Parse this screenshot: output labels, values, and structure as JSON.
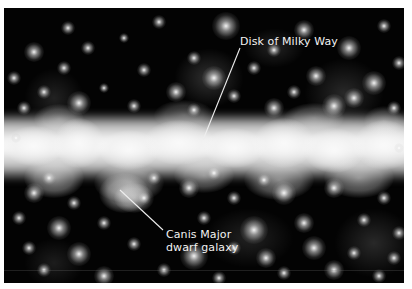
{
  "image": {
    "description": "Infrared star field showing the bright band of the Milky Way disk with the Canis Major dwarf galaxy below it",
    "background_color": "#030303",
    "frame_color": "#ffffff"
  },
  "annotations": [
    {
      "id": "disk",
      "lines": [
        "Disk of Milky Way"
      ],
      "text_pos": [
        236,
        27
      ],
      "leader": {
        "x1": 236,
        "y1": 40,
        "x2": 199,
        "y2": 132
      }
    },
    {
      "id": "canis",
      "lines": [
        "Canis Major",
        "dwarf galaxy"
      ],
      "text_pos": [
        162,
        220
      ],
      "leader": {
        "x1": 116,
        "y1": 182,
        "x2": 159,
        "y2": 222
      }
    }
  ],
  "band_patches": [
    [
      0,
      118,
      60,
      40,
      0.9
    ],
    [
      50,
      110,
      50,
      50,
      0.85
    ],
    [
      95,
      122,
      60,
      40,
      0.9
    ],
    [
      140,
      112,
      70,
      45,
      0.85
    ],
    [
      200,
      120,
      60,
      40,
      0.9
    ],
    [
      250,
      110,
      60,
      50,
      0.85
    ],
    [
      300,
      120,
      60,
      45,
      0.9
    ],
    [
      350,
      112,
      60,
      50,
      0.85
    ],
    [
      20,
      150,
      60,
      40,
      0.55
    ],
    [
      90,
      155,
      70,
      40,
      0.5
    ],
    [
      170,
      150,
      60,
      35,
      0.45
    ],
    [
      240,
      152,
      70,
      40,
      0.5
    ],
    [
      320,
      150,
      70,
      40,
      0.5
    ],
    [
      30,
      96,
      50,
      30,
      0.35
    ],
    [
      150,
      92,
      60,
      30,
      0.3
    ],
    [
      280,
      95,
      60,
      30,
      0.35
    ],
    [
      360,
      98,
      40,
      30,
      0.3
    ],
    [
      95,
      165,
      50,
      40,
      0.55
    ],
    [
      110,
      175,
      40,
      30,
      0.5
    ]
  ],
  "glow_patches": [
    [
      170,
      40,
      70,
      60,
      0.18
    ],
    [
      300,
      50,
      80,
      70,
      0.15
    ],
    [
      20,
      60,
      60,
      60,
      0.12
    ],
    [
      330,
      200,
      80,
      70,
      0.15
    ],
    [
      200,
      200,
      90,
      60,
      0.12
    ],
    [
      20,
      230,
      60,
      50,
      0.1
    ],
    [
      240,
      20,
      60,
      40,
      0.12
    ]
  ],
  "stars": [
    [
      222,
      18,
      6
    ],
    [
      64,
      20,
      3
    ],
    [
      155,
      14,
      3
    ],
    [
      300,
      22,
      4
    ],
    [
      380,
      18,
      3
    ],
    [
      120,
      30,
      2
    ],
    [
      30,
      44,
      4
    ],
    [
      84,
      40,
      3
    ],
    [
      190,
      50,
      3
    ],
    [
      270,
      42,
      3
    ],
    [
      345,
      40,
      5
    ],
    [
      395,
      55,
      3
    ],
    [
      10,
      70,
      3
    ],
    [
      60,
      60,
      3
    ],
    [
      140,
      62,
      3
    ],
    [
      210,
      70,
      5
    ],
    [
      250,
      60,
      3
    ],
    [
      312,
      68,
      4
    ],
    [
      370,
      75,
      5
    ],
    [
      40,
      84,
      3
    ],
    [
      100,
      80,
      2
    ],
    [
      172,
      84,
      4
    ],
    [
      230,
      88,
      3
    ],
    [
      290,
      84,
      3
    ],
    [
      350,
      90,
      4
    ],
    [
      20,
      100,
      3
    ],
    [
      75,
      95,
      5
    ],
    [
      130,
      98,
      3
    ],
    [
      190,
      102,
      3
    ],
    [
      270,
      100,
      4
    ],
    [
      330,
      98,
      5
    ],
    [
      390,
      100,
      3
    ],
    [
      30,
      185,
      4
    ],
    [
      70,
      195,
      3
    ],
    [
      140,
      190,
      3
    ],
    [
      185,
      180,
      4
    ],
    [
      230,
      190,
      3
    ],
    [
      280,
      185,
      5
    ],
    [
      330,
      180,
      4
    ],
    [
      380,
      190,
      3
    ],
    [
      15,
      210,
      3
    ],
    [
      55,
      220,
      5
    ],
    [
      100,
      215,
      3
    ],
    [
      200,
      210,
      3
    ],
    [
      250,
      222,
      6
    ],
    [
      300,
      215,
      4
    ],
    [
      360,
      212,
      3
    ],
    [
      395,
      225,
      3
    ],
    [
      25,
      240,
      3
    ],
    [
      75,
      246,
      5
    ],
    [
      130,
      236,
      3
    ],
    [
      190,
      248,
      6
    ],
    [
      230,
      240,
      3
    ],
    [
      262,
      250,
      4
    ],
    [
      310,
      240,
      5
    ],
    [
      350,
      245,
      3
    ],
    [
      390,
      250,
      3
    ],
    [
      40,
      262,
      3
    ],
    [
      100,
      268,
      4
    ],
    [
      160,
      262,
      3
    ],
    [
      215,
      270,
      3
    ],
    [
      280,
      265,
      3
    ],
    [
      330,
      262,
      4
    ],
    [
      375,
      268,
      3
    ],
    [
      12,
      130,
      2
    ],
    [
      395,
      140,
      2
    ],
    [
      150,
      170,
      3
    ],
    [
      210,
      165,
      3
    ],
    [
      260,
      172,
      3
    ],
    [
      45,
      170,
      3
    ]
  ],
  "scanline_y": 262
}
